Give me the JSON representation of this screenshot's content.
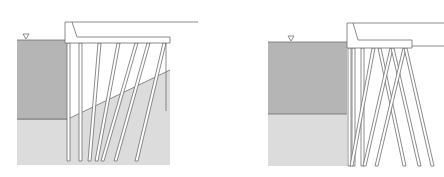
{
  "figure": {
    "colors": {
      "background": "#ffffff",
      "water": "#b5b5b5",
      "soil": "#dcdcdc",
      "line": "#6e6e6e",
      "deck": "#ffffff",
      "pile_fill": "#ffffff"
    },
    "panels": [
      {
        "id": "left",
        "label": "Wharf with inclined piles on sloping seabed",
        "water_level_symbol": "▽"
      },
      {
        "id": "right",
        "label": "Wharf with cross-braced (batter) piles",
        "water_level_symbol": "▽"
      }
    ]
  }
}
